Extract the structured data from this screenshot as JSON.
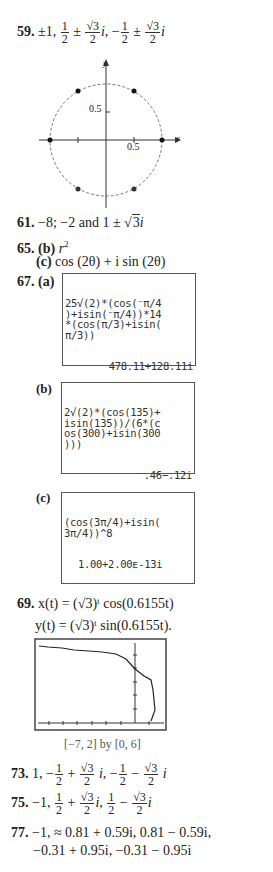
{
  "problems": {
    "p59": {
      "number": "59.",
      "answer": "±1, 1/2 ± (√3/2)i, −1/2 ± (√3/2)i",
      "prefix": "±1,",
      "frac_half_num": "1",
      "frac_half_den": "2",
      "pm": "±",
      "sqrt3": "√3",
      "i": "i",
      "minus": "−"
    },
    "p59_graph": {
      "y_label": "y",
      "x_label": "x",
      "tick_y": "0.5",
      "tick_x": "0.5"
    },
    "p61": {
      "number": "61.",
      "answer": "−8; −2 and 1 ± √3i",
      "text_a": "−8; −2 and 1 ±",
      "sqrt": "3",
      "i": "i"
    },
    "p65": {
      "number": "65.",
      "b_label": "(b)",
      "b_answer": "r",
      "b_exp": "2",
      "c_label": "(c)",
      "c_answer": "cos (2θ) + i sin (2θ)"
    },
    "p67": {
      "number": "67.",
      "a_label": "(a)",
      "a_screen": "25√(2)*(cos(⁻π/4\n)+isin(⁻π/4))*14\n*(cos(π/3)+isin(\nπ/3))",
      "a_result": "478.11+128.11i",
      "b_label": "(b)",
      "b_screen": "2√(2)*(cos(135)+\nisin(135))/(6*(c\nos(300)+isin(300\n)))",
      "b_result": "⁻.46−.12i",
      "c_label": "(c)",
      "c_screen": "(cos(3π/4)+isin(\n3π/4))^8",
      "c_result": "1.00+2.00ᴇ-13i"
    },
    "p69": {
      "number": "69.",
      "x_eq": "x(t) = (√3)ᵗ cos(0.6155t)",
      "y_eq": "y(t) = (√3)ᵗ sin(0.6155t).",
      "window": "[−7, 2] by [0, 6]"
    },
    "p73": {
      "number": "73.",
      "answer": "1, −1/2 + (√3/2) i, −1/2 − (√3/2) i"
    },
    "p75": {
      "number": "75.",
      "answer": "−1, 1/2 + (√3/2)i, 1/2 − (√3/2)i"
    },
    "p77": {
      "number": "77.",
      "line1": "−1, ≈ 0.81 + 0.59i, 0.81 − 0.59i,",
      "line2": "−0.31 + 0.95i, −0.31 − 0.95i"
    }
  }
}
